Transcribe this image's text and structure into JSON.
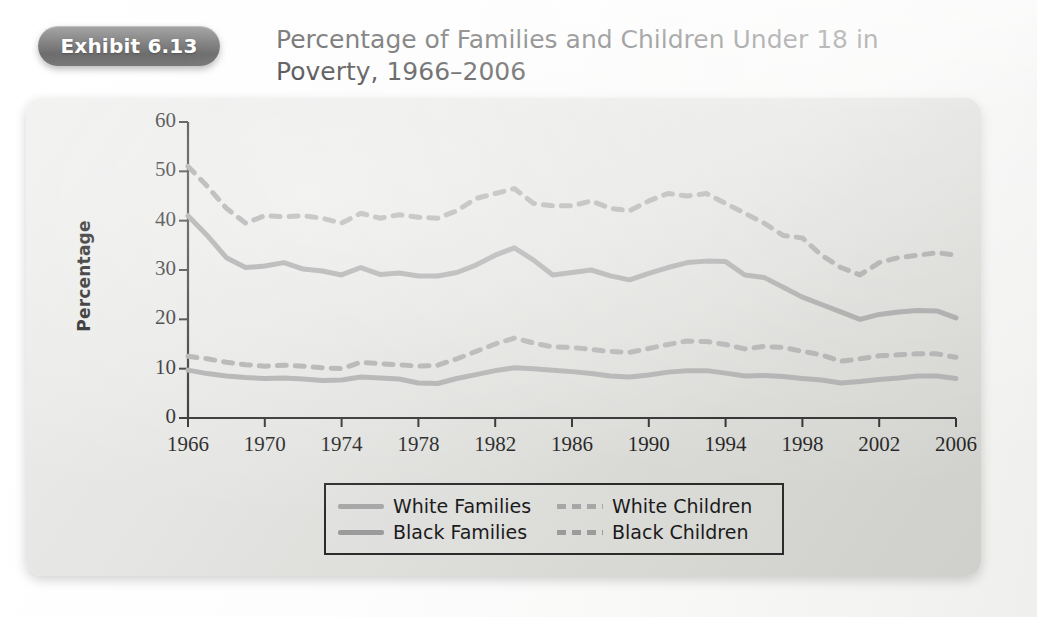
{
  "exhibit": {
    "badge_label": "Exhibit 6.13",
    "title": "Percentage of Families and Children Under 18 in Poverty, 1966–2006"
  },
  "chart_data": {
    "type": "line",
    "title": "Percentage of Families and Children Under 18 in Poverty, 1966–2006",
    "xlabel": "",
    "ylabel": "Percentage",
    "xlim": [
      1966,
      2006
    ],
    "ylim": [
      0,
      60
    ],
    "yticks": [
      0,
      10,
      20,
      30,
      40,
      50,
      60
    ],
    "xticks": [
      1966,
      1970,
      1974,
      1978,
      1982,
      1986,
      1990,
      1994,
      1998,
      2002,
      2006
    ],
    "grid": false,
    "legend_position": "bottom-center",
    "x": [
      1966,
      1967,
      1968,
      1969,
      1970,
      1971,
      1972,
      1973,
      1974,
      1975,
      1976,
      1977,
      1978,
      1979,
      1980,
      1981,
      1982,
      1983,
      1984,
      1985,
      1986,
      1987,
      1988,
      1989,
      1990,
      1991,
      1992,
      1993,
      1994,
      1995,
      1996,
      1997,
      1998,
      1999,
      2000,
      2001,
      2002,
      2003,
      2004,
      2005,
      2006
    ],
    "series": [
      {
        "name": "White Families",
        "style": "solid",
        "color": "#a9a9a9",
        "values": [
          9.7,
          9.0,
          8.5,
          8.2,
          8.0,
          8.1,
          7.9,
          7.6,
          7.7,
          8.3,
          8.1,
          7.9,
          7.1,
          7.0,
          8.0,
          8.8,
          9.6,
          10.2,
          10.0,
          9.7,
          9.4,
          9.0,
          8.5,
          8.3,
          8.7,
          9.3,
          9.6,
          9.6,
          9.1,
          8.5,
          8.6,
          8.4,
          8.0,
          7.7,
          7.1,
          7.4,
          7.8,
          8.1,
          8.5,
          8.5,
          8.0
        ]
      },
      {
        "name": "Black Families",
        "style": "solid",
        "color": "#9d9d9d",
        "values": [
          41.0,
          37.0,
          32.5,
          30.5,
          30.8,
          31.5,
          30.2,
          29.8,
          29.0,
          30.5,
          29.1,
          29.4,
          28.8,
          28.8,
          29.5,
          31.0,
          33.0,
          34.5,
          32.0,
          29.0,
          29.5,
          30.0,
          28.8,
          28.0,
          29.3,
          30.5,
          31.5,
          31.8,
          31.7,
          29.0,
          28.5,
          26.5,
          24.5,
          23.0,
          21.5,
          20.0,
          21.0,
          21.5,
          21.8,
          21.7,
          20.3
        ]
      },
      {
        "name": "White Children",
        "style": "dashed",
        "color": "#a9a9a9",
        "values": [
          12.5,
          12.0,
          11.3,
          10.8,
          10.5,
          10.7,
          10.5,
          10.2,
          10.0,
          11.3,
          11.0,
          10.8,
          10.5,
          10.7,
          12.0,
          13.5,
          15.0,
          16.2,
          15.2,
          14.4,
          14.3,
          13.9,
          13.5,
          13.3,
          14.1,
          14.9,
          15.6,
          15.5,
          14.9,
          14.0,
          14.5,
          14.3,
          13.5,
          12.8,
          11.5,
          12.0,
          12.6,
          12.8,
          13.0,
          13.0,
          12.3
        ]
      },
      {
        "name": "Black Children",
        "style": "dashed",
        "color": "#9d9d9d",
        "values": [
          51.0,
          47.0,
          42.5,
          39.5,
          41.0,
          40.8,
          41.0,
          40.5,
          39.5,
          41.5,
          40.5,
          41.2,
          40.7,
          40.5,
          42.0,
          44.5,
          45.5,
          46.5,
          43.5,
          43.0,
          43.0,
          44.0,
          42.5,
          42.0,
          44.0,
          45.5,
          45.0,
          45.5,
          43.5,
          41.5,
          39.5,
          37.0,
          36.5,
          33.0,
          30.5,
          29.0,
          31.5,
          32.5,
          33.0,
          33.5,
          33.0
        ]
      }
    ],
    "legend": [
      {
        "label": "White Families",
        "style": "solid",
        "tone": "light"
      },
      {
        "label": "White Children",
        "style": "dashed",
        "tone": "light"
      },
      {
        "label": "Black Families",
        "style": "solid",
        "tone": "dark"
      },
      {
        "label": "Black Children",
        "style": "dashed",
        "tone": "dark"
      }
    ],
    "axis_color": "#262626",
    "line_color_light": "#a9a9a9",
    "line_color_dark": "#9d9d9d"
  }
}
